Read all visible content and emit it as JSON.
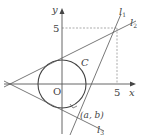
{
  "diagram": {
    "axes": {
      "x_label": "x",
      "y_label": "y",
      "origin_label": "O",
      "x_tick": "5",
      "y_tick": "5"
    },
    "circle": {
      "label": "C"
    },
    "lines": {
      "l1": {
        "name": "l",
        "sub": "1"
      },
      "l2": {
        "name": "l",
        "sub": "2"
      },
      "l3": {
        "name": "l",
        "sub": "3"
      }
    },
    "point_label": "(a, b)",
    "colors": {
      "stroke": "#555555",
      "dashed": "#888888",
      "text": "#444444"
    }
  }
}
